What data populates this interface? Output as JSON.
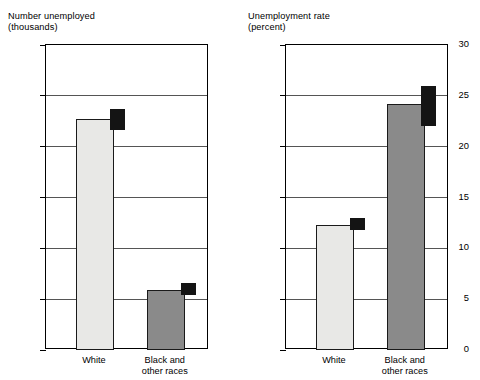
{
  "chart_data": [
    {
      "type": "bar",
      "panel": "left",
      "title": "Number unemployed\n(thousands)",
      "title_line1": "Number unemployed",
      "title_line2": "(thousands)",
      "xlabel": "",
      "ylabel": "Number unemployed (thousands)",
      "ylim": [
        0,
        1200
      ],
      "yticks": [
        0,
        200,
        400,
        600,
        800,
        1000,
        1200
      ],
      "ytick_labels": [
        "0",
        "200",
        "400",
        "600",
        "800",
        "1,000",
        "1,200"
      ],
      "grid": true,
      "legend": "none",
      "categories": [
        "White",
        "Black and\nother races"
      ],
      "category_labels_line1": [
        "White",
        "Black and"
      ],
      "category_labels_line2": [
        "",
        "other races"
      ],
      "values": [
        910,
        235
      ],
      "bar_colors": [
        "#e8e8e6",
        "#8a8a8a"
      ],
      "markers": [
        {
          "category": "White",
          "low": 865,
          "high": 950,
          "color": "#141414"
        },
        {
          "category": "Black and other races",
          "low": 215,
          "high": 265,
          "color": "#141414"
        }
      ]
    },
    {
      "type": "bar",
      "panel": "right",
      "title": "Unemployment rate\n(percent)",
      "title_line1": "Unemployment rate",
      "title_line2": "(percent)",
      "xlabel": "",
      "ylabel": "Unemployment rate (percent)",
      "ylim": [
        0,
        30
      ],
      "yticks": [
        0,
        5,
        10,
        15,
        20,
        25,
        30
      ],
      "ytick_labels": [
        "0",
        "5",
        "10",
        "15",
        "20",
        "25",
        "30"
      ],
      "grid": true,
      "legend": "none",
      "categories": [
        "White",
        "Black and\nother races"
      ],
      "category_labels_line1": [
        "White",
        "Black and"
      ],
      "category_labels_line2": [
        "",
        "other races"
      ],
      "values": [
        12.3,
        24.2
      ],
      "bar_colors": [
        "#e8e8e6",
        "#8a8a8a"
      ],
      "markers": [
        {
          "category": "White",
          "low": 11.8,
          "high": 13.0,
          "color": "#141414"
        },
        {
          "category": "Black and other races",
          "low": 22.0,
          "high": 26.0,
          "color": "#141414"
        }
      ]
    }
  ],
  "left_chart": {
    "title_line1": "Number unemployed",
    "title_line2": "(thousands)",
    "ytick_labels": [
      "1,200",
      "1,000",
      "800",
      "600",
      "400",
      "200",
      "0"
    ],
    "cat1_line1": "White",
    "cat1_line2": "",
    "cat2_line1": "Black and",
    "cat2_line2": "other races"
  },
  "right_chart": {
    "title_line1": "Unemployment rate",
    "title_line2": "(percent)",
    "ytick_labels": [
      "30",
      "25",
      "20",
      "15",
      "10",
      "5",
      "0"
    ],
    "cat1_line1": "White",
    "cat1_line2": "",
    "cat2_line1": "Black and",
    "cat2_line2": "other races"
  }
}
